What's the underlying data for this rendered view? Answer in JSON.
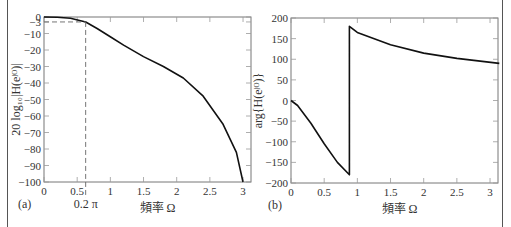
{
  "caption": "圖 — 巴特沃斯低通濾波器的頻率響應：(a) 幅度響應，(b) 相位響應",
  "chart_data": [
    {
      "type": "line",
      "panel": "(a)",
      "title": "",
      "xlabel": "頻率 Ω",
      "ylabel": "20 log10 |H(e^jΩ)|",
      "xlim": [
        0,
        3.14
      ],
      "ylim": [
        -100,
        0
      ],
      "xticks": [
        "0",
        "0.5",
        "1",
        "1.5",
        "2",
        "2.5",
        "3"
      ],
      "yticks": [
        "0",
        "-3",
        "-10",
        "-20",
        "-30",
        "-40",
        "-50",
        "-60",
        "-70",
        "-80",
        "-90",
        "-100"
      ],
      "annotations": [
        "0.2 π",
        "-3 dB dashed line at Ω = 0.2π"
      ],
      "x": [
        0,
        0.2,
        0.4,
        0.628,
        0.8,
        1.0,
        1.2,
        1.5,
        1.8,
        2.1,
        2.4,
        2.7,
        2.9,
        3.0
      ],
      "values": [
        0,
        -0.1,
        -0.8,
        -3,
        -7,
        -12,
        -17,
        -24,
        -30,
        -37,
        -48,
        -65,
        -82,
        -100
      ]
    },
    {
      "type": "line",
      "panel": "(b)",
      "title": "",
      "xlabel": "頻率 Ω",
      "ylabel": "arg{H(e^jΩ)}",
      "xlim": [
        0,
        3.14
      ],
      "ylim": [
        -200,
        200
      ],
      "xticks": [
        "0",
        "0.5",
        "1",
        "1.5",
        "2",
        "2.5",
        "3"
      ],
      "yticks": [
        "200",
        "150",
        "100",
        "50",
        "0",
        "-50",
        "-100",
        "-150",
        "-200"
      ],
      "x": [
        0,
        0.1,
        0.3,
        0.5,
        0.7,
        0.88,
        0.88,
        1.0,
        1.5,
        2.0,
        2.5,
        3.14
      ],
      "values": [
        0,
        -12,
        -55,
        -105,
        -150,
        -180,
        180,
        165,
        135,
        115,
        102,
        90
      ]
    }
  ],
  "panels": {
    "a": {
      "tag": "(a)",
      "annotation": "0.2 π",
      "xlabel": "頻率 Ω"
    },
    "b": {
      "tag": "(b)",
      "xlabel": "頻率 Ω"
    }
  }
}
